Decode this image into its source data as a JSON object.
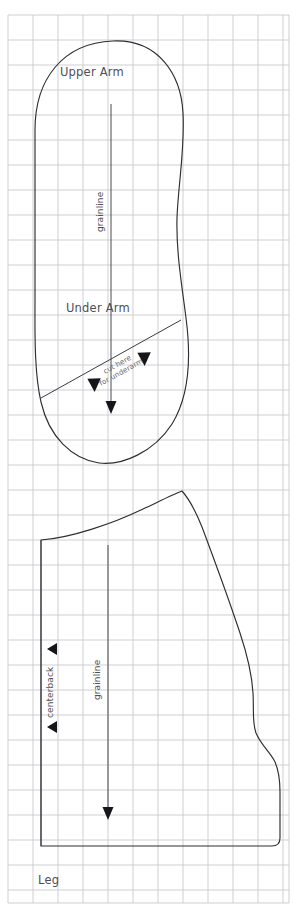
{
  "document": {
    "type": "sewing-pattern-sheet",
    "title": "Sewing pattern pieces on grid",
    "background_color": "#ffffff",
    "grid_color": "#c9c9ce",
    "outline_color": "#2e2e32",
    "label_color": "#4e4e55"
  },
  "grid": {
    "spacing_px": 25,
    "left_px": 8,
    "top_px": 15,
    "right_px": 289,
    "bottom_px": 903,
    "columns": 12,
    "rows": 36
  },
  "pieces": [
    {
      "id": "arm",
      "upper_label": "Upper Arm",
      "lower_label": "Under Arm",
      "grainline_label": "grainline",
      "cut_label_line1": "cut here",
      "cut_label_line2": "for underarm"
    },
    {
      "id": "leg",
      "label": "Leg",
      "grainline_label": "grainline",
      "centerback_label": "centerback"
    }
  ],
  "labels": {
    "upper_arm": "Upper Arm",
    "under_arm": "Under Arm",
    "arm_grainline": "grainline",
    "cut_here": "cut here",
    "for_underarm": "for underarm",
    "leg": "Leg",
    "leg_grainline": "grainline",
    "centerback": "centerback"
  },
  "footer": {
    "caption": ""
  },
  "markers": {
    "cut_triangle_count": 2,
    "centerback_triangle_count": 2,
    "grainline_arrow_count": 2
  }
}
